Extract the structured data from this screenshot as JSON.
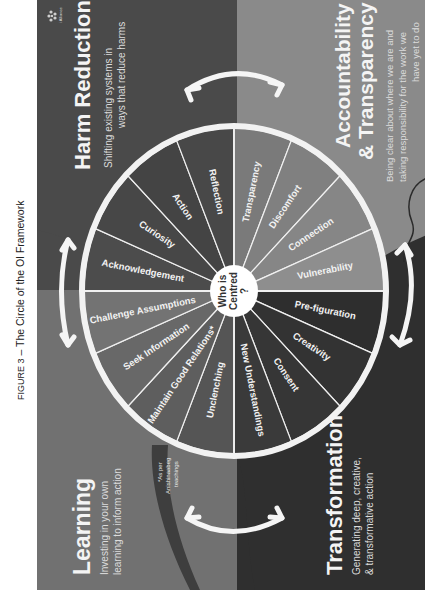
{
  "caption": {
    "figure_label": "FIGURE 3",
    "separator": " – ",
    "title": "The Circle of the OI Framework"
  },
  "logo": {
    "icon": "alliance-logo-icon",
    "text": "i Alliance"
  },
  "quadrants": {
    "harm_reduction": {
      "title": "Harm Reduction",
      "subtitle_lines": [
        "Shifting existing systems in",
        "ways that reduce harms"
      ],
      "color": "#4a4a4a"
    },
    "accountability": {
      "title_lines": [
        "Accountability",
        "& Transparency"
      ],
      "subtitle_lines": [
        "Being clear about where we are and",
        "taking responsibility for the work we",
        "have yet to do"
      ],
      "color": "#8a8a8a"
    },
    "learning": {
      "title": "Learning",
      "subtitle_lines": [
        "Investing in your own",
        "learning to inform action"
      ],
      "color": "#717171"
    },
    "transformation": {
      "title": "Transformation",
      "subtitle_lines": [
        "Generating deep, creative,",
        "& transformative action"
      ],
      "color": "#2f2f2f"
    }
  },
  "wheel": {
    "center_lines": [
      "Who is",
      "Centred",
      "?"
    ],
    "segments": [
      {
        "label": "Acknowledgement",
        "quadrant": "harm_reduction",
        "color": "#4c4c4c"
      },
      {
        "label": "Curiosity",
        "quadrant": "harm_reduction",
        "color": "#474747"
      },
      {
        "label": "Action",
        "quadrant": "harm_reduction",
        "color": "#444444"
      },
      {
        "label": "Reflection",
        "quadrant": "harm_reduction",
        "color": "#484848"
      },
      {
        "label": "Transparency",
        "quadrant": "accountability",
        "color": "#7a7a7a"
      },
      {
        "label": "Discomfort",
        "quadrant": "accountability",
        "color": "#808080"
      },
      {
        "label": "Connection",
        "quadrant": "accountability",
        "color": "#868686"
      },
      {
        "label": "Vulnerability",
        "quadrant": "accountability",
        "color": "#8e8e8e"
      },
      {
        "label": "Pre-figuration",
        "quadrant": "transformation",
        "color": "#2e2e2e"
      },
      {
        "label": "Creativity",
        "quadrant": "transformation",
        "color": "#333333"
      },
      {
        "label": "Consent",
        "quadrant": "transformation",
        "color": "#363636"
      },
      {
        "label": "New Understandings",
        "quadrant": "transformation",
        "color": "#3a3a3a"
      },
      {
        "label": "Unclenching",
        "quadrant": "learning",
        "color": "#555555"
      },
      {
        "label": "Maintain Good Relations*",
        "quadrant": "learning",
        "color": "#5e5e5e"
      },
      {
        "label": "Seek Information",
        "quadrant": "learning",
        "color": "#686868"
      },
      {
        "label": "Challenge Assumptions",
        "quadrant": "learning",
        "color": "#737373"
      }
    ]
  },
  "footnote_lines": [
    "*As per",
    "Anishinaabeg",
    "teachings"
  ],
  "arrows": [
    {
      "name": "arrow-harm-reduction-accountability",
      "icon": "double-arrow-icon"
    },
    {
      "name": "arrow-accountability-transformation",
      "icon": "double-arrow-icon"
    },
    {
      "name": "arrow-transformation-learning",
      "icon": "double-arrow-icon"
    },
    {
      "name": "arrow-learning-harm-reduction",
      "icon": "double-arrow-icon"
    }
  ]
}
